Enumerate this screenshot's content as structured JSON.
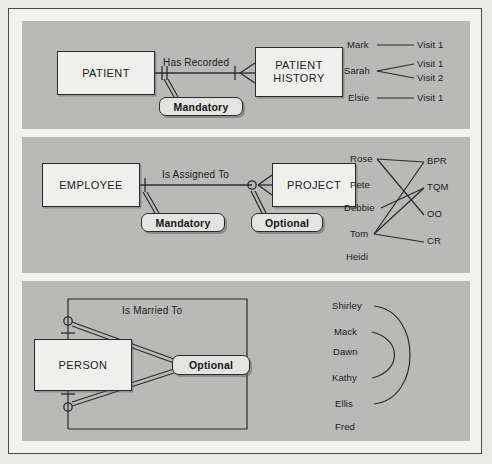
{
  "figure": {
    "panels": [
      {
        "id": "panel-1",
        "entities": [
          {
            "name": "entity-patient",
            "label": "PATIENT"
          },
          {
            "name": "entity-patient-history",
            "label": "PATIENT\nHISTORY"
          }
        ],
        "relationship_label": "Has Recorded",
        "callouts": [
          {
            "label": "Mandatory"
          }
        ],
        "instance_diagram": {
          "left_items": [
            "Mark",
            "Sarah",
            "Elsie"
          ],
          "right_items": [
            "Visit 1",
            "Visit 1",
            "Visit 2",
            "Visit 1"
          ],
          "links": [
            {
              "from": "Mark",
              "to": "Visit 1"
            },
            {
              "from": "Sarah",
              "to": "Visit 1"
            },
            {
              "from": "Sarah",
              "to": "Visit 2"
            },
            {
              "from": "Elsie",
              "to": "Visit 1"
            }
          ]
        }
      },
      {
        "id": "panel-2",
        "entities": [
          {
            "name": "entity-employee",
            "label": "EMPLOYEE"
          },
          {
            "name": "entity-project",
            "label": "PROJECT"
          }
        ],
        "relationship_label": "Is Assigned To",
        "callouts": [
          {
            "label": "Mandatory"
          },
          {
            "label": "Optional"
          }
        ],
        "instance_diagram": {
          "left_items": [
            "Rose",
            "Pete",
            "Debbie",
            "Tom",
            "Heidi"
          ],
          "right_items": [
            "BPR",
            "TQM",
            "OO",
            "CR"
          ],
          "links": [
            {
              "from": "Rose",
              "to": "BPR"
            },
            {
              "from": "Rose",
              "to": "OO"
            },
            {
              "from": "Debbie",
              "to": "TQM"
            },
            {
              "from": "Tom",
              "to": "BPR"
            },
            {
              "from": "Tom",
              "to": "TQM"
            },
            {
              "from": "Tom",
              "to": "CR"
            }
          ]
        }
      },
      {
        "id": "panel-3",
        "entities": [
          {
            "name": "entity-person",
            "label": "PERSON"
          }
        ],
        "relationship_label": "Is Married To",
        "callouts": [
          {
            "label": "Optional"
          }
        ],
        "instance_diagram": {
          "left_items": [
            "Shirley",
            "Mack",
            "Dawn",
            "Kathy",
            "Ellis",
            "Fred"
          ],
          "right_items": [],
          "links": [
            {
              "from": "Shirley",
              "to": "Ellis"
            },
            {
              "from": "Mack",
              "to": "Kathy"
            }
          ]
        }
      }
    ],
    "colors": {
      "panel_background": "#b9b9b7",
      "page_background": "#f2f2f0",
      "entity_fill": "#efefed",
      "callout_fill": "#e4e4e2",
      "line": "#2b2b2b"
    }
  }
}
